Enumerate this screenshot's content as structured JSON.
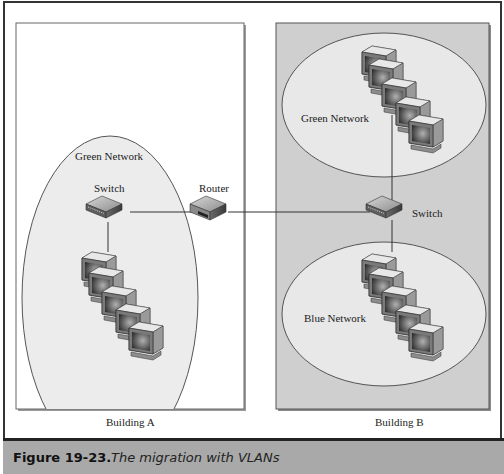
{
  "figure": {
    "number": "Figure 19-23.",
    "caption": "The migration with VLANs"
  },
  "buildings": [
    {
      "label": "Building A",
      "networks": [
        {
          "label": "Green Network",
          "computers": 5
        }
      ],
      "devices": [
        {
          "type": "switch",
          "label": "Switch"
        }
      ]
    },
    {
      "label": "Building B",
      "networks": [
        {
          "label": "Green Network",
          "computers": 5
        },
        {
          "label": "Blue Network",
          "computers": 5
        }
      ],
      "devices": [
        {
          "type": "switch",
          "label": "Switch"
        }
      ]
    }
  ],
  "router": {
    "label": "Router"
  },
  "colors": {
    "building_a_bg": "#ffffff",
    "building_b_bg": "#cfcfcf",
    "network_fill": "#e6e6e6",
    "caption_bar": "#a9a9a9"
  }
}
